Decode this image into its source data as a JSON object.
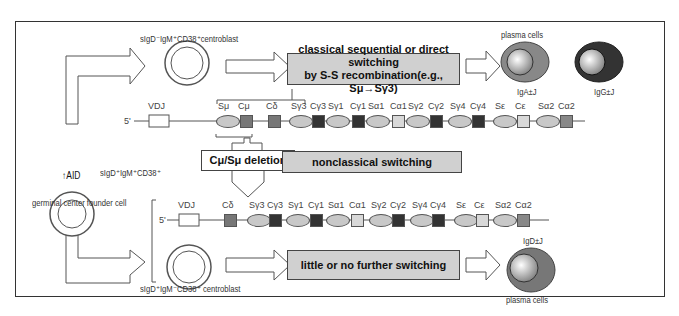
{
  "cells": {
    "top_centroblast": "sIgD⁻IgM⁺CD38⁺centroblast",
    "founder_marker": "sIgD⁺IgM⁺CD38⁺",
    "founder_label": "germinal center founder cell",
    "aid_label": "↑AID",
    "bottom_centroblast": "sIgD⁺IgM⁻CD38⁺ centroblast",
    "plasma_cells_top": "plasma cells",
    "plasma_cells_bottom": "plasma cells",
    "iga": "IgA±J",
    "igg": "IgG±J",
    "igd": "IgD±J"
  },
  "boxes": {
    "classical_line1": "classical sequential or direct switching",
    "classical_line2": "by S-S recombination(e.g., Sμ→Sγ3)",
    "nonclassical": "nonclassical switching",
    "deletion": "Cμ/Sμ deletion",
    "little": "little or no further switching"
  },
  "locus_top": {
    "prefix": "5'",
    "genes": [
      "VDJ",
      "Sμ",
      "Cμ",
      "Cδ",
      "Sγ3",
      "Cγ3",
      "Sγ1",
      "Cγ1",
      "Sα1",
      "Cα1",
      "Sγ2",
      "Cγ2",
      "Sγ4",
      "Cγ4",
      "Sε",
      "Cε",
      "Sα2",
      "Cα2"
    ]
  },
  "locus_bottom": {
    "prefix": "5'",
    "genes": [
      "VDJ",
      "Cδ",
      "Sγ3",
      "Cγ3",
      "Sγ1",
      "Cγ1",
      "Sα1",
      "Cα1",
      "Sγ2",
      "Cγ2",
      "Sγ4",
      "Cγ4",
      "Sε",
      "Cε",
      "Sα2",
      "Cα2"
    ]
  }
}
